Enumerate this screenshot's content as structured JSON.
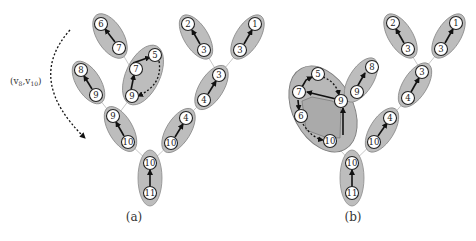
{
  "panels": [
    {
      "caption": "(a)",
      "edge_label": "(v",
      "edge_label_sub1": "8",
      "edge_label_mid": ",v",
      "edge_label_sub2": "10",
      "edge_label_end": ")",
      "nodes": {
        "n6": "6",
        "n7a": "7",
        "n5": "5",
        "n7b": "7",
        "n9a": "9",
        "n8": "8",
        "n9b": "9",
        "n9c": "9",
        "n10a": "10",
        "n2": "2",
        "n3a": "3",
        "n1": "1",
        "n3b": "3",
        "n3c": "3",
        "n4a": "4",
        "n4b": "4",
        "n10b": "10",
        "n10c": "10",
        "n11": "11"
      }
    },
    {
      "caption": "(b)",
      "nodes": {
        "n5": "5",
        "n7": "7",
        "n6": "6",
        "n9a": "9",
        "n10a": "10",
        "n8": "8",
        "n9b": "9",
        "n2": "2",
        "n3a": "3",
        "n1": "1",
        "n3b": "3",
        "n3c": "3",
        "n4a": "4",
        "n4b": "4",
        "n10b": "10",
        "n10c": "10",
        "n11": "11"
      }
    }
  ]
}
